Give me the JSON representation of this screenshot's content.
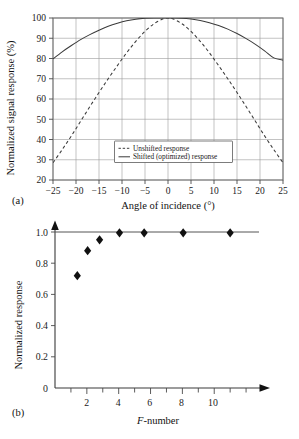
{
  "figure": {
    "panel_a_tag": "(a)",
    "panel_b_tag": "(b)"
  },
  "chart_data": [
    {
      "type": "line",
      "panel": "(a)",
      "title": "",
      "xlabel": "Angle of incidence (°)",
      "ylabel": "Normalized signal response (%)",
      "xlim": [
        -25,
        25
      ],
      "ylim": [
        20,
        100
      ],
      "xticks": [
        -25,
        -20,
        -15,
        -10,
        -5,
        0,
        5,
        10,
        15,
        20,
        25
      ],
      "xticklabels": [
        "−25",
        "−20",
        "−15",
        "−10",
        "−5",
        "0",
        "5",
        "10",
        "15",
        "20",
        "25"
      ],
      "yticks": [
        20,
        30,
        40,
        50,
        60,
        70,
        80,
        90,
        100
      ],
      "yticklabels": [
        "20",
        "30",
        "40",
        "50",
        "60",
        "70",
        "80",
        "90",
        "100"
      ],
      "grid": true,
      "legend_position": "center-bottom-inside",
      "series": [
        {
          "name": "Unshifted response",
          "style": "dashed",
          "x": [
            -25,
            -23,
            -21,
            -19,
            -17,
            -15,
            -13,
            -11,
            -9,
            -7,
            -5,
            -3,
            -1,
            0,
            1,
            3,
            5,
            7,
            9,
            11,
            13,
            15,
            17,
            19,
            21,
            23,
            25
          ],
          "y": [
            28.5,
            35.0,
            41.8,
            49.0,
            56.2,
            63.2,
            70.0,
            76.5,
            82.8,
            88.5,
            93.4,
            97.2,
            99.6,
            100.0,
            99.6,
            97.2,
            93.4,
            88.5,
            82.8,
            76.5,
            70.0,
            63.2,
            56.2,
            49.0,
            41.8,
            35.0,
            28.5
          ]
        },
        {
          "name": "Shifted (optimized) response",
          "style": "solid",
          "x": [
            -25,
            -23,
            -21,
            -19,
            -17,
            -15,
            -13,
            -11,
            -9,
            -7,
            -5,
            -3,
            -1,
            0,
            1,
            3,
            5,
            7,
            9,
            11,
            13,
            15,
            17,
            19,
            21,
            23,
            25
          ],
          "y": [
            79.8,
            83.3,
            86.4,
            89.3,
            91.8,
            94.0,
            95.9,
            97.4,
            98.6,
            99.4,
            99.85,
            100.0,
            100.0,
            100.0,
            100.0,
            99.9,
            99.5,
            98.8,
            97.7,
            96.3,
            94.5,
            92.3,
            89.8,
            87.0,
            83.8,
            80.3,
            79.2
          ]
        }
      ],
      "legend": [
        "Unshifted response",
        "Shifted (optimized) response"
      ]
    },
    {
      "type": "scatter",
      "panel": "(b)",
      "title": "",
      "xlabel": "F-number",
      "xlabel_italic_prefix": "F",
      "xlabel_rest": "-number",
      "ylabel": "Normalized response",
      "xlim": [
        0,
        13
      ],
      "ylim": [
        0,
        1.08
      ],
      "xticks": [
        1,
        2,
        3,
        4,
        5,
        6,
        7,
        8,
        9,
        10,
        11,
        12
      ],
      "xticklabels_major": [
        "2",
        "4",
        "6",
        "8",
        "10"
      ],
      "xticks_major": [
        2,
        4,
        6,
        8,
        10
      ],
      "yticks": [
        0,
        0.2,
        0.4,
        0.6,
        0.8,
        1.0
      ],
      "yticklabels": [
        "0",
        "0.2",
        "0.4",
        "0.6",
        "0.8",
        "1.0"
      ],
      "grid": false,
      "asymptote_y": 1.0,
      "marker": "diamond",
      "points": [
        {
          "x": 1.4,
          "y": 0.72
        },
        {
          "x": 2.05,
          "y": 0.88
        },
        {
          "x": 2.8,
          "y": 0.95
        },
        {
          "x": 4.05,
          "y": 0.995
        },
        {
          "x": 5.6,
          "y": 0.995
        },
        {
          "x": 8.05,
          "y": 0.995
        },
        {
          "x": 11.0,
          "y": 0.995
        }
      ]
    }
  ]
}
